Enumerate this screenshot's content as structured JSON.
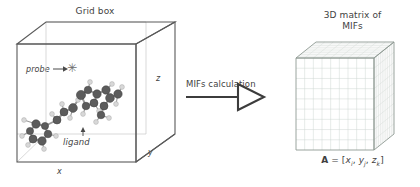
{
  "figure": {
    "background": "#ffffff",
    "line_color": "#555555",
    "grid_color": "#c9c9c9",
    "text_color": "#3f3f3f"
  },
  "left_panel": {
    "title": "Grid box",
    "axes": {
      "x": "x",
      "y": "y",
      "z": "z"
    },
    "probe": {
      "label": "probe",
      "glyph": "✳",
      "glyph_name": "asterisk-probe-icon"
    },
    "ligand": {
      "label": "ligand"
    },
    "molecule": {
      "name": "ligand-molecule",
      "carbon_color": "#5c5c5c",
      "hydrogen_color": "#d8d8d8",
      "bond_color": "#9a9a9a",
      "atoms": [
        {
          "x": 36,
          "y": 124,
          "r": 4.2,
          "t": "C"
        },
        {
          "x": 30,
          "y": 131,
          "r": 3.6,
          "t": "C"
        },
        {
          "x": 33,
          "y": 139,
          "r": 4.0,
          "t": "C"
        },
        {
          "x": 42,
          "y": 141,
          "r": 4.2,
          "t": "C"
        },
        {
          "x": 48,
          "y": 134,
          "r": 3.8,
          "t": "C"
        },
        {
          "x": 45,
          "y": 126,
          "r": 3.6,
          "t": "C"
        },
        {
          "x": 24,
          "y": 120,
          "r": 2.4,
          "t": "H"
        },
        {
          "x": 22,
          "y": 136,
          "r": 2.4,
          "t": "H"
        },
        {
          "x": 28,
          "y": 145,
          "r": 2.4,
          "t": "H"
        },
        {
          "x": 44,
          "y": 149,
          "r": 2.4,
          "t": "H"
        },
        {
          "x": 56,
          "y": 136,
          "r": 2.4,
          "t": "H"
        },
        {
          "x": 57,
          "y": 120,
          "r": 4.0,
          "t": "C"
        },
        {
          "x": 52,
          "y": 114,
          "r": 2.4,
          "t": "H"
        },
        {
          "x": 64,
          "y": 112,
          "r": 4.0,
          "t": "C"
        },
        {
          "x": 62,
          "y": 104,
          "r": 2.4,
          "t": "H"
        },
        {
          "x": 73,
          "y": 108,
          "r": 4.4,
          "t": "C"
        },
        {
          "x": 78,
          "y": 100,
          "r": 2.4,
          "t": "H"
        },
        {
          "x": 81,
          "y": 95,
          "r": 4.6,
          "t": "C"
        },
        {
          "x": 88,
          "y": 90,
          "r": 3.8,
          "t": "C"
        },
        {
          "x": 90,
          "y": 82,
          "r": 2.4,
          "t": "H"
        },
        {
          "x": 97,
          "y": 94,
          "r": 4.2,
          "t": "C"
        },
        {
          "x": 94,
          "y": 103,
          "r": 4.0,
          "t": "C"
        },
        {
          "x": 86,
          "y": 106,
          "r": 3.8,
          "t": "C"
        },
        {
          "x": 83,
          "y": 114,
          "r": 2.4,
          "t": "H"
        },
        {
          "x": 99,
          "y": 111,
          "r": 2.4,
          "t": "H"
        },
        {
          "x": 106,
          "y": 90,
          "r": 4.2,
          "t": "C"
        },
        {
          "x": 112,
          "y": 84,
          "r": 2.4,
          "t": "H"
        },
        {
          "x": 110,
          "y": 98,
          "r": 4.4,
          "t": "C"
        },
        {
          "x": 104,
          "y": 106,
          "r": 4.0,
          "t": "C"
        },
        {
          "x": 101,
          "y": 115,
          "r": 3.8,
          "t": "C"
        },
        {
          "x": 96,
          "y": 122,
          "r": 2.4,
          "t": "H"
        },
        {
          "x": 109,
          "y": 118,
          "r": 2.4,
          "t": "H"
        },
        {
          "x": 118,
          "y": 94,
          "r": 4.2,
          "t": "C"
        },
        {
          "x": 122,
          "y": 87,
          "r": 2.4,
          "t": "H"
        },
        {
          "x": 116,
          "y": 104,
          "r": 2.4,
          "t": "H"
        },
        {
          "x": 70,
          "y": 118,
          "r": 2.4,
          "t": "H"
        }
      ],
      "bonds": [
        [
          0,
          1
        ],
        [
          1,
          2
        ],
        [
          2,
          3
        ],
        [
          3,
          4
        ],
        [
          4,
          5
        ],
        [
          5,
          0
        ],
        [
          0,
          6
        ],
        [
          1,
          7
        ],
        [
          2,
          8
        ],
        [
          3,
          9
        ],
        [
          4,
          10
        ],
        [
          5,
          11
        ],
        [
          11,
          12
        ],
        [
          11,
          13
        ],
        [
          13,
          14
        ],
        [
          13,
          15
        ],
        [
          15,
          16
        ],
        [
          15,
          17
        ],
        [
          17,
          18
        ],
        [
          18,
          19
        ],
        [
          18,
          20
        ],
        [
          20,
          21
        ],
        [
          21,
          22
        ],
        [
          22,
          17
        ],
        [
          22,
          23
        ],
        [
          21,
          24
        ],
        [
          20,
          25
        ],
        [
          25,
          26
        ],
        [
          25,
          27
        ],
        [
          27,
          28
        ],
        [
          28,
          29
        ],
        [
          29,
          30
        ],
        [
          29,
          31
        ],
        [
          27,
          32
        ],
        [
          32,
          33
        ],
        [
          32,
          34
        ],
        [
          15,
          35
        ]
      ]
    }
  },
  "arrow": {
    "caption": "MIFs calculation",
    "name": "mifs-calculation-arrow"
  },
  "right_panel": {
    "title_line1": "3D matrix of",
    "title_line2": "MIFs",
    "formula": {
      "matrix_symbol": "A",
      "equals": "=",
      "open": "[",
      "terms": [
        {
          "var": "x",
          "sub": "i",
          "sep": ","
        },
        {
          "var": "y",
          "sub": "j",
          "sep": ","
        },
        {
          "var": "z",
          "sub": "k",
          "sep": ""
        }
      ],
      "close": "]",
      "plain": "A = [xi, yj, zk]"
    },
    "cube": {
      "name": "mifs-matrix-cube",
      "grid_divisions": 9,
      "face_color": "#ffffff",
      "grid_color": "#cfd6d2"
    }
  }
}
